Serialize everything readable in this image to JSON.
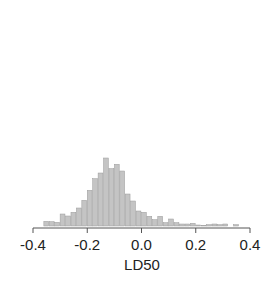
{
  "chart_data": {
    "type": "bar",
    "title": "",
    "xlabel": "LD50",
    "ylabel": "",
    "xlim": [
      -0.4,
      0.4
    ],
    "xticks": [
      -0.4,
      -0.2,
      0.0,
      0.2,
      0.4
    ],
    "xtick_labels": [
      "-0.4",
      "-0.2",
      "0.0",
      "0.2",
      "0.4"
    ],
    "bin_width": 0.02,
    "bin_start": -0.36,
    "grid": false,
    "legend": null,
    "values": [
      14,
      13,
      11,
      36,
      30,
      41,
      54,
      77,
      107,
      142,
      159,
      204,
      172,
      185,
      165,
      96,
      75,
      45,
      41,
      29,
      19,
      29,
      10,
      21,
      10,
      6,
      6,
      8,
      3,
      2,
      4,
      6,
      4,
      6,
      0,
      4
    ]
  },
  "colors": {
    "bar_fill": "#c4c4c4",
    "bar_edge": "#9a9a9a",
    "axis": "#555555"
  }
}
